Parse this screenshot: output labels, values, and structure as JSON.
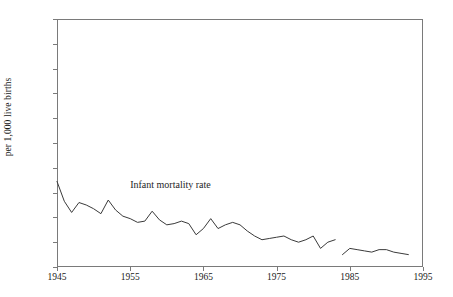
{
  "chart_data": {
    "type": "line",
    "title": "",
    "xlabel": "",
    "ylabel": "per 1,000 live births",
    "xlim": [
      1945,
      1995
    ],
    "ylim": [
      0,
      100
    ],
    "grid": false,
    "legend_position": "none",
    "x_ticks": [
      "1945",
      "1955",
      "1965",
      "1975",
      "1985",
      "1995"
    ],
    "x_tick_values": [
      1945,
      1955,
      1965,
      1975,
      1985,
      1995
    ],
    "y_ticks": [
      "0",
      "10",
      "20",
      "30",
      "40",
      "50",
      "60",
      "70",
      "80",
      "90",
      "100"
    ],
    "y_tick_values": [
      0,
      10,
      20,
      30,
      40,
      50,
      60,
      70,
      80,
      90,
      100
    ],
    "annotations": [
      {
        "text": "Infant mortality rate",
        "x": 1960.5,
        "y": 33
      }
    ],
    "series": [
      {
        "name": "Infant mortality rate",
        "segments": [
          {
            "x": [
              1945,
              1946,
              1947,
              1948,
              1949,
              1950,
              1951,
              1952,
              1953,
              1954,
              1955,
              1956,
              1957,
              1958,
              1959,
              1960,
              1961,
              1962,
              1963,
              1964,
              1965,
              1966,
              1967,
              1968,
              1969,
              1970,
              1971,
              1972,
              1973,
              1974,
              1975,
              1976,
              1977,
              1978,
              1979,
              1980,
              1981,
              1982,
              1983
            ],
            "y": [
              34.5,
              26.5,
              22.0,
              26.0,
              25.0,
              23.5,
              21.5,
              27.0,
              23.0,
              20.5,
              19.5,
              18.0,
              18.5,
              22.5,
              19.0,
              17.0,
              17.5,
              18.5,
              17.5,
              13.0,
              15.5,
              19.5,
              15.5,
              17.0,
              18.0,
              17.0,
              14.5,
              12.5,
              11.0,
              11.5,
              12.0,
              12.5,
              11.0,
              10.0,
              11.0,
              12.5,
              7.5,
              10.0,
              11.0
            ]
          },
          {
            "x": [
              1984,
              1985,
              1986,
              1987,
              1988,
              1989,
              1990,
              1991,
              1992,
              1993
            ],
            "y": [
              5.0,
              7.5,
              7.0,
              6.5,
              6.0,
              7.0,
              7.0,
              6.0,
              5.5,
              5.0
            ]
          }
        ]
      }
    ]
  },
  "axis": {
    "y_title": "per 1,000 live births"
  }
}
